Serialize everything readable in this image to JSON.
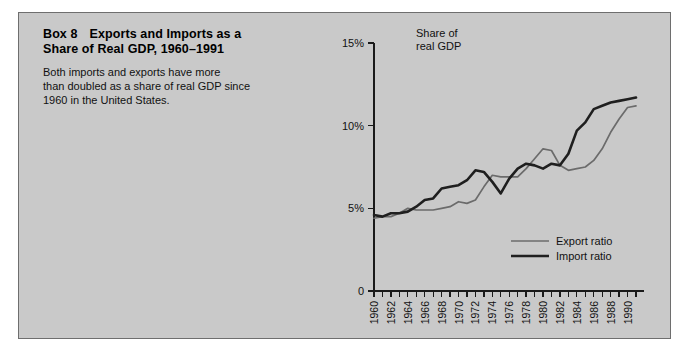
{
  "panel": {
    "background_color": "#c9c9c9",
    "border_color": "#6e6e6e"
  },
  "box": {
    "label": "Box 8",
    "title": "Exports and Imports as a",
    "title_line2": "Share of Real GDP, 1960–1991",
    "description_line1": "Both imports and exports have more",
    "description_line2": "than doubled as a share of real GDP since",
    "description_line3": "1960 in the United States."
  },
  "axis_title": {
    "line1": "Share of",
    "line2": "real GDP"
  },
  "legend": {
    "position": "inside-lower-right",
    "entries": [
      {
        "name": "Export ratio",
        "color": "#6b6b6b",
        "width": 1.7
      },
      {
        "name": "Import ratio",
        "color": "#1f1f1f",
        "width": 2.6
      }
    ]
  },
  "chart_data": {
    "type": "line",
    "xlabel": "",
    "ylabel": "Share of real GDP",
    "grid": false,
    "xlim": [
      1960,
      1991
    ],
    "ylim": [
      0,
      15
    ],
    "ytick_labels": [
      "0",
      "5%",
      "10%",
      "15%"
    ],
    "ytick_values": [
      0,
      5,
      10,
      15
    ],
    "xtick_labels": [
      "1960",
      "1962",
      "1964",
      "1966",
      "1968",
      "1970",
      "1972",
      "1974",
      "1976",
      "1978",
      "1980",
      "1982",
      "1984",
      "1986",
      "1988",
      "1990"
    ],
    "xtick_values": [
      1960,
      1962,
      1964,
      1966,
      1968,
      1970,
      1972,
      1974,
      1976,
      1978,
      1980,
      1982,
      1984,
      1986,
      1988,
      1990
    ],
    "minor_xticks_every": 1,
    "x": [
      1960,
      1961,
      1962,
      1963,
      1964,
      1965,
      1966,
      1967,
      1968,
      1969,
      1970,
      1971,
      1972,
      1973,
      1974,
      1975,
      1976,
      1977,
      1978,
      1979,
      1980,
      1981,
      1982,
      1983,
      1984,
      1985,
      1986,
      1987,
      1988,
      1989,
      1990,
      1991
    ],
    "series": [
      {
        "name": "Export ratio",
        "color": "#6b6b6b",
        "values": [
          4.4,
          4.5,
          4.5,
          4.7,
          5.0,
          4.9,
          4.9,
          4.9,
          5.0,
          5.1,
          5.4,
          5.3,
          5.5,
          6.3,
          7.0,
          6.9,
          6.9,
          6.9,
          7.4,
          8.0,
          8.6,
          8.5,
          7.6,
          7.3,
          7.4,
          7.5,
          7.9,
          8.6,
          9.6,
          10.4,
          11.1,
          11.2
        ]
      },
      {
        "name": "Import ratio",
        "color": "#1f1f1f",
        "values": [
          4.6,
          4.5,
          4.7,
          4.7,
          4.8,
          5.1,
          5.5,
          5.6,
          6.2,
          6.3,
          6.4,
          6.7,
          7.3,
          7.2,
          6.6,
          5.9,
          6.8,
          7.4,
          7.7,
          7.6,
          7.4,
          7.7,
          7.6,
          8.3,
          9.7,
          10.2,
          11.0,
          11.2,
          11.4,
          11.5,
          11.6,
          11.7
        ]
      }
    ]
  }
}
